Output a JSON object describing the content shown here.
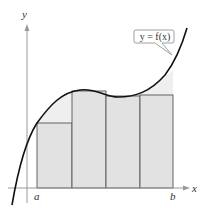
{
  "diagram": {
    "axes": {
      "x_label": "x",
      "y_label": "y"
    },
    "interval": {
      "start_label": "a",
      "end_label": "b"
    },
    "curve_label": "y = f(x)",
    "rectangles": [
      {
        "x": 37,
        "top": 123,
        "width": 35
      },
      {
        "x": 72,
        "top": 91,
        "width": 34
      },
      {
        "x": 106,
        "top": 96,
        "width": 34
      },
      {
        "x": 140,
        "top": 95,
        "width": 33
      }
    ],
    "colors": {
      "rect_fill": "#e2e2e2",
      "region_fill": "#efefef",
      "rect_stroke": "#555555",
      "curve": "#111111",
      "axis": "#999999"
    }
  }
}
